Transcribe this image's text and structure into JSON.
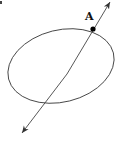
{
  "diagram": {
    "point_label": "A",
    "colors": {
      "stroke": "#333333",
      "point": "#000000",
      "background": "#ffffff"
    },
    "shapes": [
      {
        "type": "ellipse",
        "name": "ellipse"
      },
      {
        "type": "line",
        "name": "line-through-A",
        "arrows": "both"
      },
      {
        "type": "point",
        "name": "point-A",
        "label": "A"
      }
    ],
    "stray_mark": "."
  }
}
